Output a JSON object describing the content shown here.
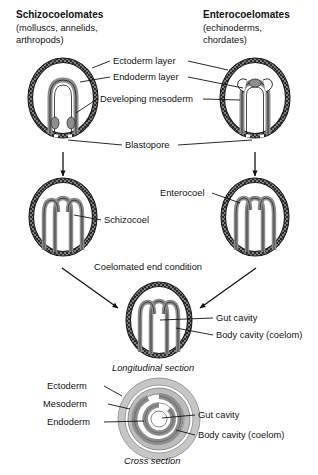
{
  "figure": {
    "type": "biology-diagram"
  },
  "columns": {
    "left": {
      "title": "Schizocoelomates",
      "subtitle_line1": "(molluscs, annelids,",
      "subtitle_line2": "arthropods)"
    },
    "right": {
      "title": "Enterocoelomates",
      "subtitle_line1": "(echinoderms,",
      "subtitle_line2": "chordates)"
    }
  },
  "stage1_labels": {
    "ectoderm": "Ectoderm layer",
    "endoderm": "Endoderm layer",
    "mesoderm": "Developing mesoderm",
    "blastopore": "Blastopore"
  },
  "stage2_labels": {
    "schizocoel": "Schizocoel",
    "enterocoel": "Enterocoel"
  },
  "stage3": {
    "heading": "Coelomated end condition",
    "gut_cavity": "Gut cavity",
    "body_cavity": "Body cavity (coelom)",
    "caption": "Longitudinal section"
  },
  "cross_section": {
    "ectoderm": "Ectoderm",
    "mesoderm": "Mesoderm",
    "endoderm": "Endoderm",
    "gut_cavity": "Gut cavity",
    "body_cavity": "Body cavity (coelom)",
    "caption": "Cross section"
  },
  "colors": {
    "ink": "#111111",
    "ectoderm_ring": "#1a1a1a",
    "mesoderm_gray": "#8d8d8d",
    "light_gray": "#b9b9b9",
    "background": "#ffffff"
  }
}
